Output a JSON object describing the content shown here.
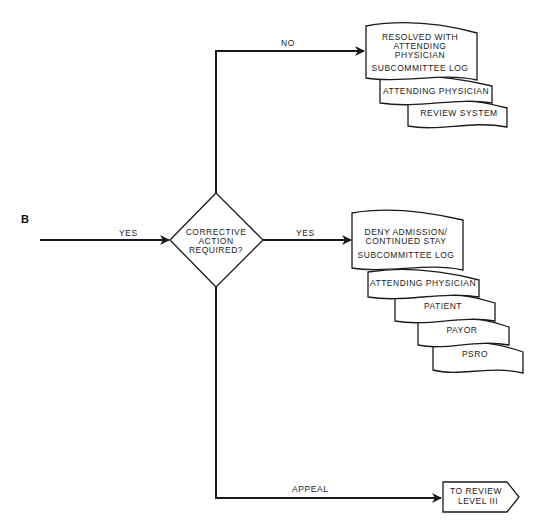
{
  "section_label": "B",
  "entry": {
    "label": "YES"
  },
  "decision": {
    "lines": [
      "CORRECTIVE",
      "ACTION",
      "REQUIRED?"
    ]
  },
  "branches": {
    "no": {
      "label": "NO",
      "documents": [
        {
          "lines": [
            "RESOLVED WITH",
            "ATTENDING",
            "PHYSICIAN",
            "SUBCOMMITTEE LOG"
          ]
        },
        {
          "lines": [
            "ATTENDING PHYSICIAN"
          ]
        },
        {
          "lines": [
            "REVIEW SYSTEM"
          ]
        }
      ]
    },
    "yes": {
      "label": "YES",
      "documents": [
        {
          "lines": [
            "DENY ADMISSION/",
            "CONTINUED STAY",
            "SUBCOMMITTEE LOG"
          ]
        },
        {
          "lines": [
            "ATTENDING PHYSICIAN"
          ]
        },
        {
          "lines": [
            "PATIENT"
          ]
        },
        {
          "lines": [
            "PAYOR"
          ]
        },
        {
          "lines": [
            "PSRO"
          ]
        }
      ]
    },
    "appeal": {
      "label": "APPEAL",
      "terminator": {
        "lines": [
          "TO REVIEW",
          "LEVEL III"
        ]
      }
    }
  },
  "colors": {
    "stroke": "#1a1a1a",
    "background": "#ffffff",
    "text": "#222222"
  }
}
